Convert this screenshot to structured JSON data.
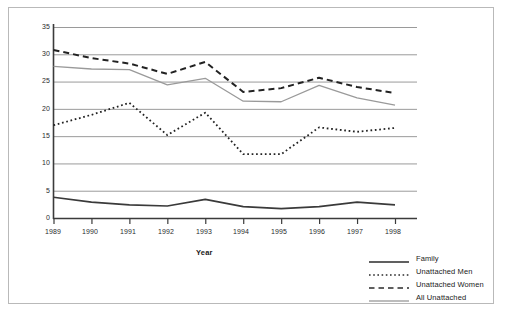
{
  "chart_data": {
    "type": "line",
    "title": "",
    "xlabel": "Year",
    "ylabel": "Percentage",
    "categories": [
      "1989",
      "1990",
      "1991",
      "1992",
      "1993",
      "1994",
      "1995",
      "1996",
      "1997",
      "1998"
    ],
    "x": [
      1989,
      1990,
      1991,
      1992,
      1993,
      1994,
      1995,
      1996,
      1997,
      1998
    ],
    "ylim": [
      0,
      35
    ],
    "yticks": [
      0,
      5,
      10,
      15,
      20,
      25,
      30,
      35
    ],
    "grid": "horizontal",
    "legend_position": "bottom-right",
    "series": [
      {
        "name": "Family",
        "style": "solid",
        "color": "#3a3a3a",
        "values": [
          3.8,
          2.9,
          2.4,
          2.2,
          3.4,
          2.1,
          1.7,
          2.1,
          2.9,
          2.4
        ]
      },
      {
        "name": "Unattached Men",
        "style": "dotted",
        "color": "#222222",
        "values": [
          17.0,
          18.9,
          21.1,
          15.2,
          19.3,
          11.7,
          11.7,
          16.6,
          15.8,
          16.5
        ]
      },
      {
        "name": "Unattached Women",
        "style": "dashed",
        "color": "#222222",
        "values": [
          30.8,
          29.3,
          28.3,
          26.4,
          28.6,
          23.1,
          23.8,
          25.7,
          24.0,
          22.9
        ]
      },
      {
        "name": "All Unattached",
        "style": "solid-light",
        "color": "#9a9a9a",
        "values": [
          27.8,
          27.3,
          27.2,
          24.4,
          25.6,
          21.4,
          21.3,
          24.3,
          22.0,
          20.7
        ]
      }
    ]
  },
  "axis": {
    "y_title": "Percentage",
    "x_title": "Year",
    "y_ticks": [
      "35",
      "30",
      "25",
      "20",
      "15",
      "10",
      "5",
      "0"
    ],
    "x_ticks": [
      "1989",
      "1990",
      "1991",
      "1992",
      "1993",
      "1994",
      "1995",
      "1996",
      "1997",
      "1998"
    ]
  },
  "legend": {
    "items": [
      {
        "label": "Family",
        "style": "solid"
      },
      {
        "label": "Unattached Men",
        "style": "dotted"
      },
      {
        "label": "Unattached Women",
        "style": "dashed"
      },
      {
        "label": "All Unattached",
        "style": "solid-light"
      }
    ]
  }
}
